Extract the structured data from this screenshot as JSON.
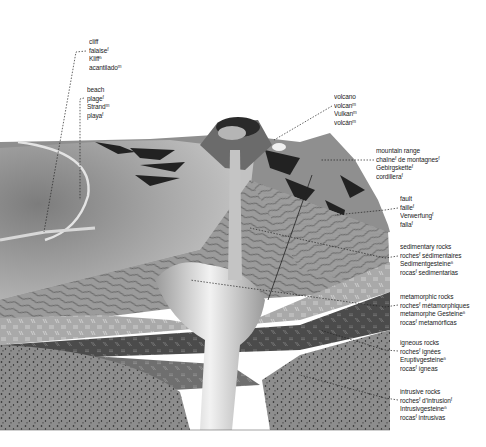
{
  "diagram": {
    "labels": [
      {
        "id": "cliff",
        "terms": [
          "cliff",
          "falaiseᶠ",
          "Kliffⁿ",
          "acantiladoᵐ"
        ],
        "x": 89,
        "y": 38
      },
      {
        "id": "beach",
        "terms": [
          "beach",
          "plageᶠ",
          "Strandᵐ",
          "playaᶠ"
        ],
        "x": 87,
        "y": 86
      },
      {
        "id": "volcano",
        "terms": [
          "volcano",
          "volcanᵐ",
          "Vulkanᵐ",
          "volcánᵐ"
        ],
        "x": 334,
        "y": 93
      },
      {
        "id": "mountain-range",
        "terms": [
          "mountain range",
          "chaîneᶠ de montagnesᶠ",
          "Gebirgsketteᶠ",
          "cordilleraᶠ"
        ],
        "x": 376,
        "y": 147
      },
      {
        "id": "fault",
        "terms": [
          "fault",
          "failleᶠ",
          "Verwerfungᶠ",
          "fallaᶠ"
        ],
        "x": 400,
        "y": 195
      },
      {
        "id": "sedimentary-rocks",
        "terms": [
          "sedimentary rocks",
          "rochesᶠ sédimentaires",
          "Sedimentgesteineⁿ",
          "rocasᶠ sedimentarias"
        ],
        "x": 400,
        "y": 243
      },
      {
        "id": "metamorphic-rocks",
        "terms": [
          "metamorphic rocks",
          "rochesᶠ métamorphiques",
          "metamorphe Gesteineⁿ",
          "rocasᶠ metamórficas"
        ],
        "x": 400,
        "y": 293
      },
      {
        "id": "igneous-rocks",
        "terms": [
          "igneous rocks",
          "rochesᶠ ignées",
          "Eruptivgesteineⁿ",
          "rocasᶠ ígneas"
        ],
        "x": 400,
        "y": 339
      },
      {
        "id": "intrusive-rocks",
        "terms": [
          "intrusive rocks",
          "rochesᶠ d’intrusionᶠ",
          "Intrusivgesteineⁿ",
          "rocasᶠ intrusivas"
        ],
        "x": 400,
        "y": 388
      }
    ]
  },
  "colors": {
    "background": "#ffffff",
    "sea_surface": "#b9b9b9",
    "terrain": "#8e8e8e",
    "shadow": "#1f1f1f",
    "sedimentary": "#9a9a9a",
    "metamorphic": "#a8a8a8",
    "igneous": "#4a4a4a",
    "intrusive": "#8a8a8a",
    "magma": "#c8c8c8",
    "text": "#1a1a1a"
  }
}
